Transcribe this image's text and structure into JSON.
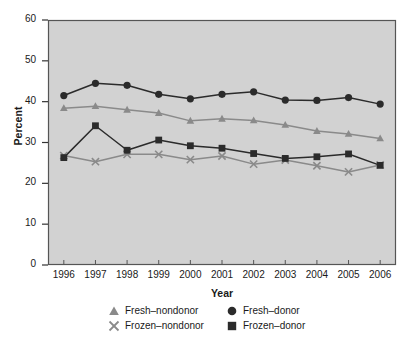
{
  "chart_data": {
    "type": "line",
    "title": "",
    "xlabel": "Year",
    "ylabel": "Percent",
    "categories": [
      "1996",
      "1997",
      "1998",
      "1999",
      "2000",
      "2001",
      "2002",
      "2003",
      "2004",
      "2005",
      "2006"
    ],
    "x": [
      1996,
      1997,
      1998,
      1999,
      2000,
      2001,
      2002,
      2003,
      2004,
      2005,
      2006
    ],
    "xlim": [
      1995.5,
      2006.5
    ],
    "ylim": [
      0,
      60
    ],
    "yticks": [
      0,
      10,
      20,
      30,
      40,
      50,
      60
    ],
    "ytick_labels": [
      "0",
      "10",
      "20",
      "30",
      "40",
      "50",
      "60"
    ],
    "xtick_labels": [
      "1996",
      "1997",
      "1998",
      "1999",
      "2000",
      "2001",
      "2002",
      "2003",
      "2004",
      "2005",
      "2006"
    ],
    "grid": false,
    "legend_position": "below-axes",
    "plot_background": "#d2d2d2",
    "series": [
      {
        "name": "Fresh–nondonor",
        "marker": "triangle",
        "color": "#8a8a8a",
        "values": [
          38.4,
          38.9,
          38.0,
          37.2,
          35.3,
          35.8,
          35.4,
          34.3,
          32.8,
          32.1,
          31.0
        ]
      },
      {
        "name": "Fresh–donor",
        "marker": "circle",
        "color": "#2b2b2b",
        "values": [
          41.5,
          44.5,
          44.0,
          41.8,
          40.7,
          41.8,
          42.4,
          40.4,
          40.3,
          41.0,
          39.4
        ]
      },
      {
        "name": "Frozen–nondonor",
        "marker": "x",
        "color": "#8a8a8a",
        "values": [
          26.8,
          25.3,
          27.1,
          27.1,
          25.8,
          26.7,
          24.7,
          25.7,
          24.3,
          22.8,
          24.5
        ]
      },
      {
        "name": "Frozen–donor",
        "marker": "square",
        "color": "#2b2b2b",
        "values": [
          26.3,
          34.1,
          28.1,
          30.6,
          29.2,
          28.6,
          27.3,
          26.1,
          26.5,
          27.2,
          24.4
        ]
      }
    ]
  },
  "legend": {
    "items": [
      {
        "label": "Fresh–nondonor",
        "marker": "triangle",
        "color": "#8a8a8a"
      },
      {
        "label": "Fresh–donor",
        "marker": "circle",
        "color": "#2b2b2b"
      },
      {
        "label": "Frozen–nondonor",
        "marker": "x",
        "color": "#8a8a8a"
      },
      {
        "label": "Frozen–donor",
        "marker": "square",
        "color": "#2b2b2b"
      }
    ]
  }
}
